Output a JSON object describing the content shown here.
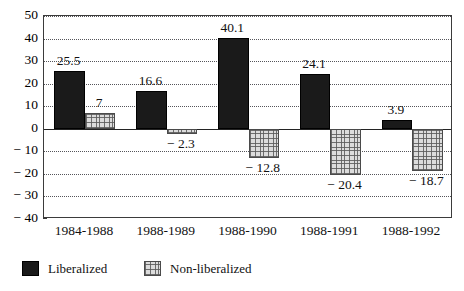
{
  "chart_data": {
    "type": "bar",
    "title": "",
    "subtitle": "",
    "xlabel": "",
    "ylabel": "",
    "categories": [
      "1984-1988",
      "1988-1989",
      "1988-1990",
      "1988-1991",
      "1988-1992"
    ],
    "series": [
      {
        "name": "Liberalized",
        "color": "#1a1a1a",
        "values": [
          25.5,
          16.6,
          40.1,
          24.1,
          3.9
        ],
        "labels": [
          "25.5",
          "16.6",
          "40.1",
          "24.1",
          "3.9"
        ]
      },
      {
        "name": "Non-liberalized",
        "color": "#dcdcdc",
        "values": [
          7,
          -2.3,
          -12.8,
          -20.4,
          -18.7
        ],
        "labels": [
          "7",
          "− 2.3",
          "− 12.8",
          "− 20.4",
          "− 18.7"
        ]
      }
    ],
    "ylim": [
      -40,
      50
    ],
    "yticks": [
      50,
      40,
      30,
      20,
      10,
      0,
      -10,
      -20,
      -30,
      -40
    ],
    "ytick_labels": [
      "50",
      "40",
      "30",
      "20",
      "10",
      "0",
      "− 10",
      "− 20",
      "− 30",
      "− 40"
    ],
    "grid": true,
    "grid_style": "dotted",
    "legend_position": "bottom-left",
    "zero_line": true
  },
  "legend": {
    "items": [
      {
        "label": "Liberalized",
        "swatch": "solid-black"
      },
      {
        "label": "Non-liberalized",
        "swatch": "gray-crosshatch"
      }
    ]
  }
}
